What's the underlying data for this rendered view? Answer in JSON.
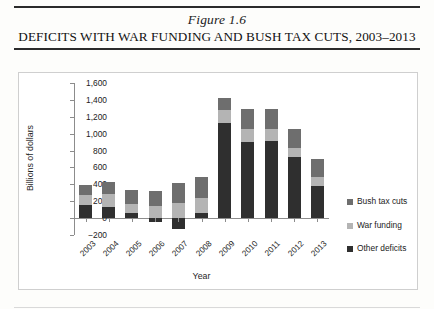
{
  "figure": {
    "number": "Figure 1.6",
    "title_prefix": "D",
    "title": "DEFICITS WITH WAR FUNDING AND BUSH TAX CUTS, 2003–2013"
  },
  "legend": {
    "position": "right",
    "items": [
      {
        "label": "Bush tax cuts",
        "color": "#6e6e6e",
        "name": "bush-tax-cuts"
      },
      {
        "label": "War funding",
        "color": "#b4b4b4",
        "name": "war-funding"
      },
      {
        "label": "Other deficits",
        "color": "#2f2f2f",
        "name": "other-deficits"
      }
    ]
  },
  "axes": {
    "y_title": "Billions of dollars",
    "x_title": "Year",
    "y_ticks": [
      "1,600",
      "1,400",
      "1,200",
      "1,000",
      "800",
      "600",
      "400",
      "200",
      "0",
      "−200"
    ]
  },
  "chart_data": {
    "type": "bar",
    "stacked": true,
    "title": "Deficits with War Funding and Bush Tax Cuts, 2003–2013",
    "xlabel": "Year",
    "ylabel": "Billions of dollars",
    "ylim": [
      -200,
      1600
    ],
    "ytick_step": 200,
    "grid": false,
    "legend_position": "right",
    "categories": [
      "2003",
      "2004",
      "2005",
      "2006",
      "2007",
      "2008",
      "2009",
      "2010",
      "2011",
      "2012",
      "2013"
    ],
    "series": [
      {
        "name": "Other deficits",
        "color": "#2f2f2f",
        "values": [
          160,
          130,
          60,
          -50,
          -130,
          60,
          1130,
          900,
          910,
          720,
          380
        ]
      },
      {
        "name": "War funding",
        "color": "#b4b4b4",
        "values": [
          110,
          150,
          110,
          140,
          180,
          180,
          150,
          160,
          150,
          110,
          110
        ]
      },
      {
        "name": "Bush tax cuts",
        "color": "#6e6e6e",
        "values": [
          120,
          150,
          160,
          180,
          240,
          250,
          140,
          230,
          230,
          220,
          210
        ]
      }
    ],
    "totals_positive": [
      390,
      430,
      330,
      320,
      420,
      490,
      1420,
      1290,
      1290,
      1050,
      700
    ],
    "totals_negative": [
      0,
      0,
      0,
      -50,
      -130,
      0,
      0,
      0,
      0,
      0,
      0
    ]
  }
}
